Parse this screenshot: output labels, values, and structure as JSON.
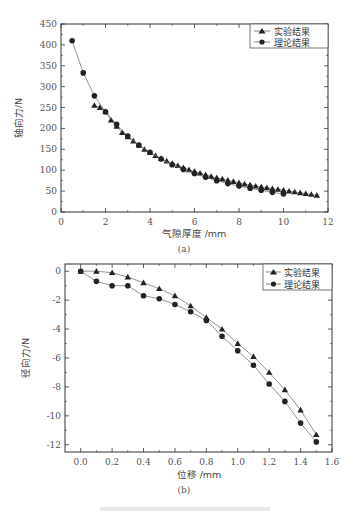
{
  "chart_data": [
    {
      "id": "a",
      "type": "line",
      "subcaption": "(a)",
      "xlabel": "气隙厚度 /mm",
      "ylabel": "轴向力/N",
      "xlim": [
        0,
        12
      ],
      "ylim": [
        0,
        450
      ],
      "xticks": [
        0,
        2,
        4,
        6,
        8,
        10,
        12
      ],
      "yticks": [
        0,
        50,
        100,
        150,
        200,
        250,
        300,
        350,
        400,
        450
      ],
      "grid": false,
      "legend_position": "upper right",
      "series": [
        {
          "name": "实验结果",
          "marker": "triangle",
          "x": [
            1.5,
            1.75,
            2.0,
            2.25,
            2.5,
            2.75,
            3.0,
            3.25,
            3.5,
            3.75,
            4.0,
            4.25,
            4.5,
            4.75,
            5.0,
            5.25,
            5.5,
            5.75,
            6.0,
            6.25,
            6.5,
            6.75,
            7.0,
            7.25,
            7.5,
            7.75,
            8.0,
            8.25,
            8.5,
            8.75,
            9.0,
            9.25,
            9.5,
            9.75,
            10.0,
            10.25,
            10.5,
            10.75,
            11.0,
            11.25,
            11.5
          ],
          "y": [
            255,
            250,
            240,
            220,
            205,
            190,
            180,
            170,
            160,
            150,
            142,
            135,
            128,
            122,
            116,
            111,
            106,
            101,
            97,
            93,
            89,
            85,
            82,
            79,
            76,
            73,
            70,
            67,
            65,
            62,
            60,
            58,
            56,
            54,
            52,
            50,
            48,
            46,
            44,
            42,
            40
          ]
        },
        {
          "name": "理论结果",
          "marker": "circle",
          "x": [
            0.5,
            1.0,
            1.5,
            2.0,
            2.5,
            3.0,
            3.5,
            4.0,
            4.5,
            5.0,
            5.5,
            6.0,
            6.5,
            7.0,
            7.5,
            8.0,
            8.5,
            9.0,
            9.5,
            10.0
          ],
          "y": [
            410,
            333,
            278,
            240,
            210,
            182,
            160,
            143,
            127,
            113,
            102,
            92,
            83,
            75,
            68,
            62,
            57,
            52,
            47,
            43
          ]
        }
      ]
    },
    {
      "id": "b",
      "type": "line",
      "subcaption": "(b)",
      "xlabel": "位移 /mm",
      "ylabel": "径向力/N",
      "xlim": [
        -0.1,
        1.6
      ],
      "ylim": [
        -12.5,
        0.5
      ],
      "xticks": [
        0.0,
        0.2,
        0.4,
        0.6,
        0.8,
        1.0,
        1.2,
        1.4,
        1.6
      ],
      "yticks": [
        0,
        -2,
        -4,
        -6,
        -8,
        -10,
        -12
      ],
      "grid": false,
      "legend_position": "upper right",
      "series": [
        {
          "name": "实验结果",
          "marker": "triangle",
          "x": [
            0.0,
            0.1,
            0.2,
            0.3,
            0.4,
            0.5,
            0.6,
            0.7,
            0.8,
            0.9,
            1.0,
            1.1,
            1.2,
            1.3,
            1.4,
            1.5
          ],
          "y": [
            0.0,
            0.0,
            -0.1,
            -0.4,
            -0.8,
            -1.2,
            -1.7,
            -2.4,
            -3.2,
            -4.0,
            -5.0,
            -5.9,
            -7.0,
            -8.2,
            -9.6,
            -11.3
          ]
        },
        {
          "name": "理论结果",
          "marker": "circle",
          "x": [
            0.0,
            0.1,
            0.2,
            0.3,
            0.4,
            0.5,
            0.6,
            0.7,
            0.8,
            0.9,
            1.0,
            1.1,
            1.2,
            1.3,
            1.4,
            1.5
          ],
          "y": [
            0.0,
            -0.7,
            -1.0,
            -1.0,
            -1.7,
            -1.9,
            -2.3,
            -2.8,
            -3.4,
            -4.5,
            -5.5,
            -6.5,
            -7.8,
            -9.0,
            -10.5,
            -11.8
          ]
        }
      ]
    }
  ],
  "labels": {
    "a_caption": "(a)",
    "b_caption": "(b)",
    "a_xlabel": "气隙厚度 /mm",
    "a_ylabel": "轴向力/N",
    "b_xlabel": "位移 /mm",
    "b_ylabel": "径向力/N",
    "legend_exp": "实验结果",
    "legend_theory": "理论结果"
  }
}
